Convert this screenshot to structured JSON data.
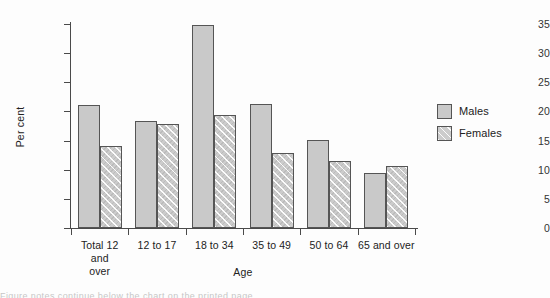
{
  "chart_data": {
    "type": "bar",
    "title": "",
    "subtitle": "",
    "xlabel": "Age",
    "ylabel": "Per cent",
    "categories": [
      "Total 12 and over",
      "12 to 17",
      "18 to 34",
      "35 to 49",
      "50 to 64",
      "65 and over"
    ],
    "category_lines": [
      [
        "Total 12 and",
        "over"
      ],
      [
        "12 to 17"
      ],
      [
        "18 to 34"
      ],
      [
        "35 to 49"
      ],
      [
        "50 to 64"
      ],
      [
        "65 and over"
      ]
    ],
    "series": [
      {
        "name": "Males",
        "values": [
          21.1,
          18.3,
          34.9,
          21.2,
          15.1,
          9.5
        ],
        "color": "#c9c9c9",
        "pattern": "solid"
      },
      {
        "name": "Females",
        "values": [
          14.0,
          17.9,
          19.4,
          12.8,
          11.5,
          10.6
        ],
        "color": "#cccccc",
        "pattern": "diagonal-hatch"
      }
    ],
    "ylim": [
      0,
      35
    ],
    "yticks": [
      0,
      5,
      10,
      15,
      20,
      25,
      30,
      35
    ],
    "ytick_labels": [
      "0",
      "5",
      "10",
      "15",
      "20",
      "25",
      "30",
      "35"
    ],
    "grid": false,
    "legend_position": "right",
    "legend_entries": [
      "Males",
      "Females"
    ]
  },
  "legend": {
    "items": [
      {
        "label": "Males"
      },
      {
        "label": "Females"
      }
    ]
  },
  "footer": {
    "cut_text": "Figure notes continue below the chart on the printed page"
  }
}
